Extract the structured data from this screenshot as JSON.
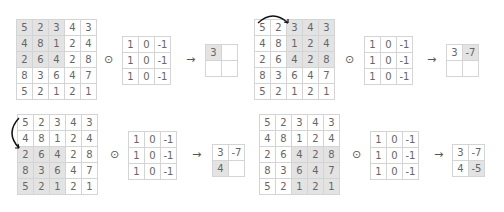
{
  "input": [
    [
      5,
      2,
      3,
      4,
      3
    ],
    [
      4,
      8,
      1,
      2,
      4
    ],
    [
      2,
      6,
      4,
      2,
      8
    ],
    [
      8,
      3,
      6,
      4,
      7
    ],
    [
      5,
      2,
      1,
      2,
      1
    ]
  ],
  "kernel": [
    [
      1,
      0,
      -1
    ],
    [
      1,
      0,
      -1
    ],
    [
      1,
      0,
      -1
    ]
  ],
  "output": [
    [
      3,
      -7
    ],
    [
      4,
      -5
    ]
  ],
  "operator": "⊙",
  "arrow": "→",
  "steps": [
    {
      "row": 0,
      "col": 0,
      "left": 16,
      "top": 19,
      "kx": 122,
      "ky": 36,
      "ox": 205,
      "oy": 44,
      "opx": 104,
      "arx": 186,
      "shown": [
        [
          3,
          ""
        ],
        [
          "",
          ""
        ]
      ]
    },
    {
      "row": 0,
      "col": 2,
      "left": 254,
      "top": 19,
      "kx": 364,
      "ky": 36,
      "ox": 446,
      "oy": 44,
      "opx": 345,
      "arx": 427,
      "shown": [
        [
          3,
          -7
        ],
        [
          "",
          ""
        ]
      ],
      "arc": "h"
    },
    {
      "row": 2,
      "col": 0,
      "left": 17,
      "top": 114,
      "kx": 128,
      "ky": 131,
      "ox": 212,
      "oy": 144,
      "opx": 110,
      "arx": 192,
      "shown": [
        [
          3,
          -7
        ],
        [
          4,
          ""
        ]
      ],
      "arc": "v"
    },
    {
      "row": 2,
      "col": 2,
      "left": 259,
      "top": 114,
      "kx": 370,
      "ky": 131,
      "ox": 452,
      "oy": 144,
      "opx": 352,
      "arx": 434,
      "shown": [
        [
          3,
          -7
        ],
        [
          4,
          -5
        ]
      ]
    }
  ]
}
